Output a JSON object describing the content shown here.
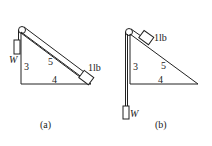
{
  "diagrams": [
    {
      "id": "a",
      "caption": "(a)",
      "side_vertical": "3",
      "side_hypotenuse": "5",
      "side_base": "4",
      "block_label": "1lb",
      "weight_label": "W"
    },
    {
      "id": "b",
      "caption": "(b)",
      "side_vertical": "3",
      "side_hypotenuse": "5",
      "side_base": "4",
      "block_label": "1lb",
      "weight_label": "W"
    }
  ],
  "colors": {
    "line": "#222222",
    "background": "#ffffff"
  }
}
